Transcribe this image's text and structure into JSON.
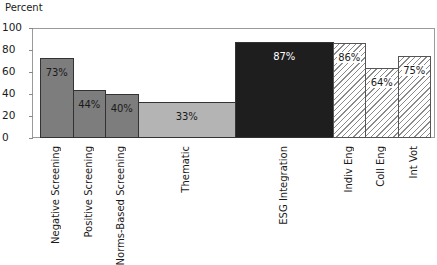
{
  "chart_data": {
    "type": "bar",
    "subtype": "variable-width (mekko)",
    "title": "",
    "xlabel": "",
    "ylabel": "Percent",
    "ylim": [
      0,
      100
    ],
    "yticks": [
      "0",
      "20",
      "40",
      "60",
      "80",
      "100"
    ],
    "grid": false,
    "legend": null,
    "categories": [
      "Negative Screening",
      "Positive Screening",
      "Norms-Based Screening",
      "Thematic",
      "ESG Integration",
      "Indiv Eng",
      "Coll Eng",
      "Int Vot"
    ],
    "values": [
      73,
      44,
      40,
      33,
      87,
      86,
      64,
      75
    ],
    "value_labels": [
      "73%",
      "44%",
      "40%",
      "33%",
      "87%",
      "86%",
      "64%",
      "75%"
    ],
    "relative_widths": [
      1,
      1,
      1,
      3,
      3,
      1,
      1,
      1
    ],
    "styles": [
      "medium-gray",
      "medium-gray",
      "medium-gray",
      "light-gray",
      "black",
      "hatched",
      "hatched",
      "hatched"
    ],
    "colors": {
      "medium-gray": "#7d7d7d",
      "light-gray": "#b4b4b4",
      "black": "#1e1e1e",
      "hatched": "#ffffff"
    }
  }
}
